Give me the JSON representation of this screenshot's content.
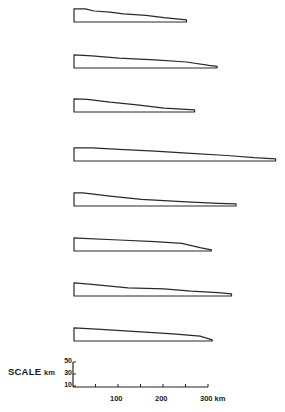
{
  "chart_data": {
    "type": "profile-diagram",
    "title": "",
    "units": {
      "horizontal": "km",
      "vertical": "km"
    },
    "profiles": [
      {
        "id": 1,
        "length_km": 250,
        "heights_km": [
          [
            0,
            24
          ],
          [
            25,
            24
          ],
          [
            45,
            20
          ],
          [
            80,
            18
          ],
          [
            110,
            15
          ],
          [
            160,
            12
          ],
          [
            200,
            8
          ],
          [
            250,
            4
          ]
        ]
      },
      {
        "id": 2,
        "length_km": 318,
        "heights_km": [
          [
            0,
            24
          ],
          [
            40,
            22
          ],
          [
            100,
            18
          ],
          [
            180,
            15
          ],
          [
            250,
            11
          ],
          [
            300,
            5
          ],
          [
            318,
            3
          ]
        ]
      },
      {
        "id": 3,
        "length_km": 268,
        "heights_km": [
          [
            0,
            24
          ],
          [
            30,
            23
          ],
          [
            80,
            18
          ],
          [
            140,
            13
          ],
          [
            200,
            7
          ],
          [
            268,
            4
          ]
        ]
      },
      {
        "id": 4,
        "length_km": 448,
        "heights_km": [
          [
            0,
            24
          ],
          [
            40,
            24
          ],
          [
            100,
            21
          ],
          [
            180,
            18
          ],
          [
            260,
            14
          ],
          [
            340,
            10
          ],
          [
            400,
            6
          ],
          [
            448,
            4
          ]
        ]
      },
      {
        "id": 5,
        "length_km": 360,
        "heights_km": [
          [
            0,
            24
          ],
          [
            20,
            24
          ],
          [
            80,
            18
          ],
          [
            150,
            12
          ],
          [
            240,
            8
          ],
          [
            320,
            5
          ],
          [
            360,
            4
          ]
        ]
      },
      {
        "id": 6,
        "length_km": 305,
        "heights_km": [
          [
            0,
            24
          ],
          [
            20,
            23
          ],
          [
            100,
            20
          ],
          [
            180,
            17
          ],
          [
            240,
            14
          ],
          [
            280,
            6
          ],
          [
            305,
            2
          ]
        ]
      },
      {
        "id": 7,
        "length_km": 350,
        "heights_km": [
          [
            0,
            24
          ],
          [
            40,
            21
          ],
          [
            120,
            15
          ],
          [
            200,
            13
          ],
          [
            260,
            9
          ],
          [
            320,
            6
          ],
          [
            350,
            4
          ]
        ]
      },
      {
        "id": 8,
        "length_km": 307,
        "heights_km": [
          [
            0,
            24
          ],
          [
            60,
            21
          ],
          [
            140,
            17
          ],
          [
            220,
            13
          ],
          [
            280,
            9
          ],
          [
            307,
            2
          ]
        ]
      }
    ],
    "scale_bar": {
      "label": "SCALE",
      "vertical_unit": "km",
      "vertical_ticks": [
        "50",
        "30",
        "10"
      ],
      "vertical_range": [
        0,
        50
      ],
      "horizontal_ticks": [
        "100",
        "200",
        "300 km"
      ],
      "horizontal_range": [
        0,
        300
      ],
      "minor_tick_interval_km": 50
    }
  }
}
